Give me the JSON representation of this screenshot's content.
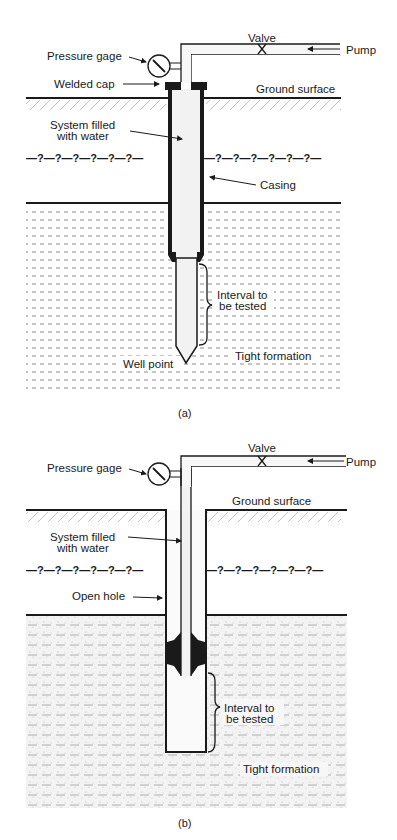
{
  "figure_a": {
    "caption": "(a)",
    "labels": {
      "valve": "Valve",
      "pump": "Pump",
      "pressure_gage": "Pressure gage",
      "welded_cap": "Welded cap",
      "ground_surface": "Ground surface",
      "system_filled_line1": "System filled",
      "system_filled_line2": "with water",
      "casing": "Casing",
      "interval_line1": "Interval to",
      "interval_line2": "be tested",
      "tight_formation": "Tight formation",
      "well_point": "Well point",
      "unknown_boundary_left": "—?—?—?—?—?—?—",
      "unknown_boundary_right": "—?—?—?—?—?—?—"
    }
  },
  "figure_b": {
    "caption": "(b)",
    "labels": {
      "valve": "Valve",
      "pump": "Pump",
      "pressure_gage": "Pressure gage",
      "ground_surface": "Ground surface",
      "system_filled_line1": "System filled",
      "system_filled_line2": "with water",
      "open_hole": "Open hole",
      "interval_line1": "Interval to",
      "interval_line2": "be tested",
      "tight_formation": "Tight formation",
      "unknown_boundary_left": "—?—?—?—?—?—?—",
      "unknown_boundary_right": "—?—?—?—?—?—?—"
    }
  },
  "colors": {
    "line": "#1a1a1a",
    "fill_water": "#f2f2f2",
    "formation_dash": "#8a8a8a",
    "sand_stipple": "#bdbdbd"
  }
}
